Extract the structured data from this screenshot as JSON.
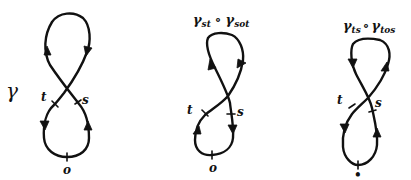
{
  "figures": [
    {
      "id": "gamma",
      "title_main": "γ",
      "title_parts": [],
      "labels": {
        "t": "t",
        "s": "s",
        "origin": "o"
      },
      "arrows": {
        "top_left": "up",
        "top_right": "down",
        "bottom_left": "down",
        "bottom_right": "up"
      }
    },
    {
      "id": "gamma-st-compose-gamma-sot",
      "title_parts": [
        {
          "symbol": "γ",
          "sub": "st"
        },
        {
          "op": "∘"
        },
        {
          "symbol": "γ",
          "sub": "sot"
        }
      ],
      "labels": {
        "t": "t",
        "s": "s",
        "origin": "o"
      },
      "arrows": {
        "top_left": "up",
        "top_right": "down",
        "bottom_left": "up",
        "bottom_right": "down"
      }
    },
    {
      "id": "gamma-ts-compose-gamma-tos",
      "title_parts": [
        {
          "symbol": "γ",
          "sub": "ts"
        },
        {
          "op": "∘"
        },
        {
          "symbol": "γ",
          "sub": "tos"
        }
      ],
      "labels": {
        "t": "t",
        "s": "s",
        "origin": "•"
      },
      "arrows": {
        "top_left": "down",
        "top_right": "up",
        "bottom_left": "down",
        "bottom_right": "up"
      }
    }
  ]
}
